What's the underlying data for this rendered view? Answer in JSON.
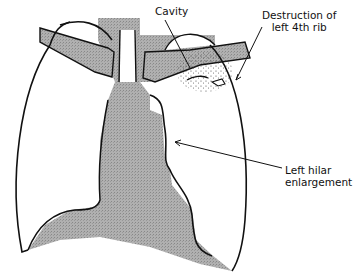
{
  "diagram": {
    "type": "anatomical-illustration",
    "colors": {
      "shading": "#a9a9a9",
      "outline": "#111111",
      "background": "#ffffff"
    },
    "labels": {
      "cavity": "Cavity",
      "rib_line1": "Destruction of",
      "rib_line2": "left 4th rib",
      "hilar_line1": "Left hilar",
      "hilar_line2": "enlargement"
    },
    "annotations": [
      {
        "label": "Cavity",
        "points_to": "cavity in left upper zone"
      },
      {
        "label": "Destruction of left 4th rib",
        "points_to": "lateral left rib"
      },
      {
        "label": "Left hilar enlargement",
        "points_to": "left hilum"
      }
    ]
  }
}
